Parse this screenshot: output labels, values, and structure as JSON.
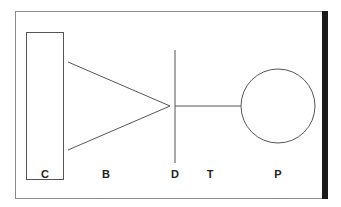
{
  "diagram": {
    "frame": {
      "stroke": "#8a8a8a",
      "right_bar_color": "#1a1a1a"
    },
    "components": [
      {
        "id": "C",
        "shape": "rectangle",
        "label": "C"
      },
      {
        "id": "B",
        "shape": "converging-lines",
        "label": "B"
      },
      {
        "id": "D",
        "shape": "vertical-line",
        "label": "D"
      },
      {
        "id": "T",
        "shape": "horizontal-line",
        "label": "T"
      },
      {
        "id": "P",
        "shape": "circle",
        "label": "P"
      }
    ],
    "labels": {
      "c": "C",
      "b": "B",
      "d": "D",
      "t": "T",
      "p": "P"
    },
    "line_color": "#555555"
  }
}
